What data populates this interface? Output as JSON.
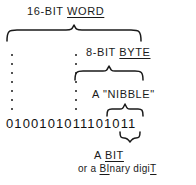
{
  "diagram": {
    "ink_color": "#1a1a1a",
    "background_color": "#ffffff",
    "labels": {
      "word": {
        "prefix": "16-BIT ",
        "underlined": "WORD",
        "full": "16-BIT WORD"
      },
      "byte": {
        "prefix": "8-BIT ",
        "underlined": "BYTE",
        "full": "8-BIT BYTE"
      },
      "nibble": {
        "full": "A \"NIBBLE\""
      },
      "bit": {
        "prefix": "A ",
        "underlined": "BIT",
        "full": "A BIT"
      },
      "bit_expansion": {
        "part1": "or a ",
        "part2": "BI",
        "part3": "nary digi",
        "part4": "T",
        "full": "or a BInary digiT"
      }
    },
    "bits": {
      "value": "0100101011101011",
      "length": 16
    },
    "braces": [
      {
        "name": "word-brace",
        "spans": "16 bits",
        "label": "16-BIT WORD"
      },
      {
        "name": "byte-brace",
        "spans": "8 bits",
        "label": "8-BIT BYTE"
      },
      {
        "name": "nibble-brace",
        "spans": "4 bits",
        "label": "A \"NIBBLE\""
      },
      {
        "name": "bit-brace",
        "spans": "1 bit",
        "label": "A BIT"
      }
    ],
    "guides": [
      {
        "name": "word-left-guide",
        "dots": 7
      },
      {
        "name": "byte-left-guide",
        "dots": 7
      }
    ]
  }
}
